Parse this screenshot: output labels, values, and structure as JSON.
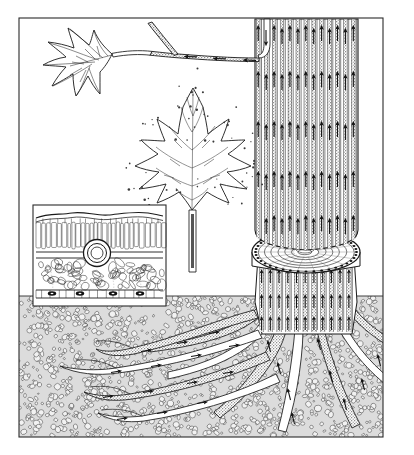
{
  "figure": {
    "style": "vintage line engraving, black ink on white",
    "canvas": {
      "width": 414,
      "height": 455,
      "background": "#ffffff"
    },
    "frame": {
      "x": 19,
      "y": 18,
      "width": 364,
      "height": 419,
      "stroke": "#2b2b2b",
      "stroke_width": 1
    },
    "colors": {
      "ink": "#1a1a1a",
      "paper": "#ffffff",
      "soil_fill": "#d9d9d9",
      "vessel_fill": "#c8c8c8",
      "arrow": "#111111"
    }
  },
  "scene": {
    "ground_line_y": 296,
    "regions": [
      {
        "name": "sky-region",
        "label": "Above-ground air",
        "y_from": 18,
        "y_to": 296
      },
      {
        "name": "soil-region",
        "label": "Soil",
        "y_from": 296,
        "y_to": 437
      }
    ]
  },
  "trunk": {
    "label": "Cut tree trunk with xylem vessels",
    "x": 255,
    "width": 103,
    "top_y": 19,
    "cut_y": 243,
    "vessel_count": 13,
    "flow_direction": "upward",
    "arrow_rows": 5,
    "stump": {
      "label": "Cut stump showing annual growth rings",
      "cx": 306,
      "cy": 252,
      "rx": 54,
      "ry": 21,
      "ring_count": 7,
      "depth": 8
    },
    "lower_trunk": {
      "label": "Lower trunk / root crown",
      "top_y": 260,
      "bottom_y": 330,
      "vessel_count": 11
    }
  },
  "branch": {
    "label": "Branch carrying water to leaf",
    "flow_direction": "toward leaf (leftward)",
    "arrow_count": 3
  },
  "leaves": [
    {
      "name": "upper-leaf",
      "label": "Maple leaf on branch",
      "cx": 92,
      "cy": 60,
      "lobes": 5,
      "transpiring": false
    },
    {
      "name": "center-leaf",
      "label": "Maple leaf transpiring water vapour",
      "cx": 192,
      "cy": 150,
      "lobes": 5,
      "transpiring": true,
      "vapour_dot_count": 60
    }
  ],
  "roots": {
    "label": "Root system absorbing soil water",
    "flow_direction": "inward and upward toward trunk",
    "lateral_root_count": 4,
    "descending_root_count": 7,
    "arrow_count": 22,
    "origin": {
      "x": 306,
      "y": 300
    }
  },
  "inset": {
    "name": "leaf-cross-section-inset",
    "label": "Leaf cross-section detail",
    "x": 33,
    "y": 205,
    "width": 133,
    "height": 101,
    "border_stroke": "#2b2b2b",
    "layers": [
      {
        "name": "cuticle-upper-layer",
        "label": "Upper cuticle / epidermis",
        "y": 212,
        "height": 8
      },
      {
        "name": "palisade-mesophyll-layer",
        "label": "Palisade mesophyll",
        "y": 220,
        "height": 26,
        "cell_count": 34
      },
      {
        "name": "vascular-bundle",
        "label": "Vascular bundle (vein)",
        "cx": 97,
        "cy": 253,
        "r_outer": 12,
        "r_inner": 7
      },
      {
        "name": "spongy-mesophyll-layer",
        "label": "Spongy mesophyll",
        "y": 258,
        "height": 32
      },
      {
        "name": "lower-epidermis-layer",
        "label": "Lower epidermis with stomata",
        "y": 290,
        "height": 9,
        "stomata_count": 4
      }
    ]
  },
  "soil": {
    "label": "Soil particles / stippled ground",
    "particle_count": 1400,
    "fill": "#d9d9d9"
  }
}
